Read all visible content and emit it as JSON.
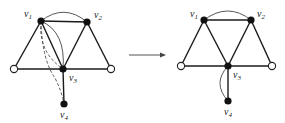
{
  "diagram": {
    "type": "graph-transformation",
    "arrow": {
      "from": "left-graph",
      "to": "right-graph"
    },
    "left_graph": {
      "nodes": [
        {
          "id": "v1",
          "label": "v",
          "sub": "1",
          "filled": true
        },
        {
          "id": "v2",
          "label": "v",
          "sub": "2",
          "filled": true
        },
        {
          "id": "v3",
          "label": "v",
          "sub": "3",
          "filled": true
        },
        {
          "id": "v4",
          "label": "v",
          "sub": "4",
          "filled": true
        },
        {
          "id": "a",
          "label": "",
          "filled": false
        },
        {
          "id": "b",
          "label": "",
          "filled": false
        }
      ],
      "edges": [
        [
          "v1",
          "v2"
        ],
        [
          "v1",
          "a"
        ],
        [
          "v1",
          "v3"
        ],
        [
          "v2",
          "v3"
        ],
        [
          "v2",
          "b"
        ],
        [
          "a",
          "v3"
        ],
        [
          "v3",
          "b"
        ],
        [
          "v3",
          "v4"
        ]
      ],
      "curved_edges": [
        {
          "from": "v1",
          "to": "v2",
          "style": "solid"
        },
        {
          "from": "v1",
          "to": "v3",
          "style": "solid"
        },
        {
          "from": "v1",
          "to": "v3",
          "style": "dashed"
        },
        {
          "from": "v1",
          "to": "v4",
          "style": "dashed"
        }
      ]
    },
    "right_graph": {
      "nodes": [
        {
          "id": "v1",
          "label": "v",
          "sub": "1",
          "filled": true
        },
        {
          "id": "v2",
          "label": "v",
          "sub": "2",
          "filled": true
        },
        {
          "id": "v3",
          "label": "v",
          "sub": "3",
          "filled": true
        },
        {
          "id": "v4",
          "label": "v",
          "sub": "4",
          "filled": true
        },
        {
          "id": "a",
          "label": "",
          "filled": false
        },
        {
          "id": "b",
          "label": "",
          "filled": false
        }
      ],
      "edges": [
        [
          "v1",
          "v2"
        ],
        [
          "v1",
          "a"
        ],
        [
          "v1",
          "v3"
        ],
        [
          "v2",
          "v3"
        ],
        [
          "v2",
          "b"
        ],
        [
          "a",
          "v3"
        ],
        [
          "v3",
          "b"
        ],
        [
          "v3",
          "v4"
        ]
      ],
      "curved_edges": [
        {
          "from": "v1",
          "to": "v2",
          "style": "solid"
        },
        {
          "from": "v3",
          "to": "v4",
          "style": "solid"
        }
      ]
    },
    "labels": {
      "v": "v",
      "s1": "1",
      "s2": "2",
      "s3": "3",
      "s4": "4"
    }
  }
}
